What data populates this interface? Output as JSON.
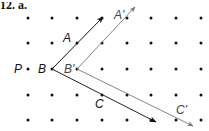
{
  "problem": {
    "label": "12. a."
  },
  "grid": {
    "columns_x": [
      28,
      52,
      77,
      102,
      127,
      151,
      176,
      201
    ],
    "rows_y": [
      18,
      43,
      69,
      95,
      120
    ],
    "dot_color": "#111111"
  },
  "labels": [
    {
      "text": "P",
      "x": 14,
      "y": 63,
      "style": "black"
    },
    {
      "text": "B",
      "x": 38,
      "y": 63,
      "style": "black"
    },
    {
      "text": "A",
      "x": 63,
      "y": 32,
      "style": "black"
    },
    {
      "text": "C",
      "x": 95,
      "y": 98,
      "style": "black"
    },
    {
      "text": "B'",
      "x": 64,
      "y": 63,
      "style": "gray"
    },
    {
      "text": "A'",
      "x": 114,
      "y": 9,
      "style": "gray"
    },
    {
      "text": "C'",
      "x": 176,
      "y": 104,
      "style": "gray"
    }
  ],
  "vectors": [
    {
      "name": "BA",
      "from": [
        52,
        69
      ],
      "to": [
        103,
        17
      ],
      "color": "#111111"
    },
    {
      "name": "BC",
      "from": [
        52,
        69
      ],
      "to": [
        156,
        122
      ],
      "color": "#222222"
    },
    {
      "name": "B'A'",
      "from": [
        77,
        69
      ],
      "to": [
        135,
        7
      ],
      "color": "#777777"
    },
    {
      "name": "B'C'",
      "from": [
        77,
        69
      ],
      "to": [
        193,
        126
      ],
      "color": "#777777"
    }
  ]
}
